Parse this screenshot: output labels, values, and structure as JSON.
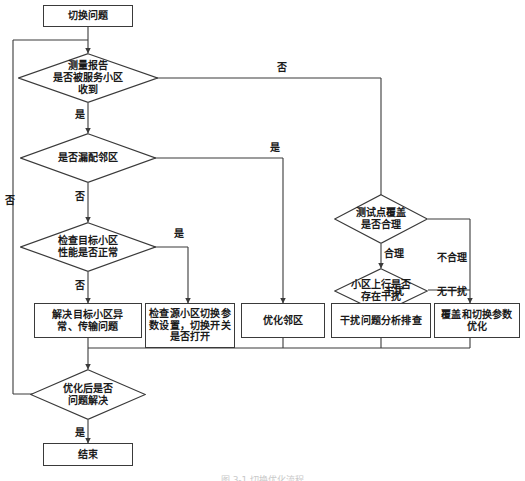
{
  "figure": {
    "caption": "图 3-1 切换优化流程",
    "line_color": "#3a3a3a",
    "text_color": "#1a1a1a",
    "background": "#ffffff"
  },
  "nodes": {
    "start": {
      "label": "切换问题",
      "shape": "box"
    },
    "d_measure_report": {
      "label": "测量报告\n是否被服务小区\n收到",
      "shape": "diamond"
    },
    "d_missing_neighbor": {
      "label": "是否漏配邻区",
      "shape": "diamond"
    },
    "d_target_cell_perf": {
      "label": "检查目标小区\n性能是否正常",
      "shape": "diamond"
    },
    "d_test_point_cover": {
      "label": "测试点覆盖\n是否合理",
      "shape": "diamond"
    },
    "d_uplink_interference": {
      "label": "小区上行是否\n存在干扰",
      "shape": "diamond"
    },
    "d_problem_solved": {
      "label": "优化后是否\n问题解决",
      "shape": "diamond"
    },
    "a_fix_target_cell": {
      "label": "解决目标小区异\n常、传输问题",
      "shape": "box"
    },
    "a_check_source_params": {
      "label": "检查源小区切换参\n数设置，切换开关\n是否打开",
      "shape": "box"
    },
    "a_optimize_neighbor": {
      "label": "优化邻区",
      "shape": "box"
    },
    "a_interference_analysis": {
      "label": "干扰问题分析排查",
      "shape": "box"
    },
    "a_coverage_ho_params": {
      "label": "覆盖和切换参数\n优化",
      "shape": "box"
    },
    "end": {
      "label": "结束",
      "shape": "box"
    }
  },
  "edge_labels": {
    "measure_no": "否",
    "measure_yes": "是",
    "neighbor_yes": "是",
    "neighbor_no": "否",
    "perf_yes": "是",
    "perf_no": "否",
    "cover_reasonable": "合理",
    "cover_unreasonable": "不合理",
    "interference_yes": "干扰",
    "interference_no": "无干扰",
    "solved_yes": "是",
    "solved_no": "否"
  }
}
